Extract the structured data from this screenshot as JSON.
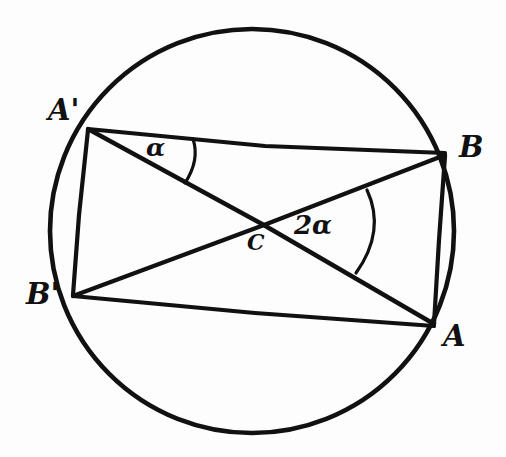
{
  "figure": {
    "ink_color": "#111111",
    "background_color": "#fdfdfd",
    "width": 506,
    "height": 457
  },
  "circle": {
    "name": "main-circle",
    "cx": 252,
    "cy": 231,
    "r": 202
  },
  "points": [
    {
      "id": "A_prime",
      "label": "A'",
      "x": 88,
      "y": 129,
      "label_x": 48,
      "label_y": 96
    },
    {
      "id": "B",
      "label": "B",
      "x": 445,
      "y": 154,
      "label_x": 459,
      "label_y": 133
    },
    {
      "id": "B_prime",
      "label": "B'",
      "x": 73,
      "y": 296,
      "label_x": 26,
      "label_y": 280
    },
    {
      "id": "A",
      "label": "A",
      "x": 434,
      "y": 325,
      "label_x": 443,
      "label_y": 322
    },
    {
      "id": "C",
      "label": "C",
      "x": 263,
      "y": 224,
      "label_x": 247,
      "label_y": 231
    }
  ],
  "segments": [
    {
      "id": "chord-Aprime-B",
      "from": "A_prime",
      "to": "B",
      "path": "M 88 129 L 265 146 L 445 153"
    },
    {
      "id": "chord-Aprime-A",
      "from": "A_prime",
      "to": "A",
      "path": "M 88 129 L 262 224 L 434 324"
    },
    {
      "id": "chord-Bprime-B",
      "from": "B_prime",
      "to": "B",
      "path": "M 73 296 L 264 225 L 445 155"
    },
    {
      "id": "chord-Bprime-A",
      "from": "B_prime",
      "to": "A",
      "path": "M 73 296 L 255 313 L 434 326"
    },
    {
      "id": "chord-Aprime-Bprime",
      "from": "A_prime",
      "to": "B_prime",
      "path": "M 88 130 L 79 215 L 73 295"
    },
    {
      "id": "chord-B-A",
      "from": "B",
      "to": "A",
      "path": "M 445 156 L 439 240 L 434 324"
    }
  ],
  "angle_marks": [
    {
      "id": "angle-alpha-at-Aprime",
      "label": "α",
      "vertex": "A_prime",
      "value": "alpha",
      "label_x": 146,
      "label_y": 135,
      "arc_path": "M 193 139 Q 200 160 185 183"
    },
    {
      "id": "angle-two-alpha-at-C",
      "label": "2α",
      "vertex": "C",
      "value": "2 alpha",
      "label_x": 294,
      "label_y": 212,
      "arc_path": "M 367 190 Q 386 231 356 273"
    }
  ]
}
